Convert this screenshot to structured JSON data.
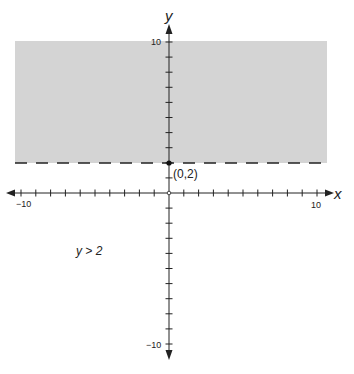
{
  "chart_data": {
    "type": "area",
    "title": "",
    "inequality": "y > 2",
    "boundary": {
      "equation": "y = 2",
      "style": "dashed"
    },
    "shaded_region": "above y = 2",
    "point": {
      "x": 0,
      "y": 2,
      "label": "(0,2)"
    },
    "xlabel": "x",
    "ylabel": "y",
    "xlim": [
      -10,
      10
    ],
    "ylim": [
      -10,
      10
    ],
    "x_tick_labels": [
      "-10",
      "10"
    ],
    "y_tick_labels": [
      "10",
      "-10"
    ],
    "grid": false,
    "colors": {
      "shade": "#d4d4d4",
      "axis": "#222222"
    }
  },
  "labels": {
    "x_axis": "x",
    "y_axis": "y",
    "x_min": "−10",
    "x_max": "10",
    "y_max": "10",
    "y_min": "−10",
    "point": "(0,2)",
    "inequality": "y > 2"
  }
}
